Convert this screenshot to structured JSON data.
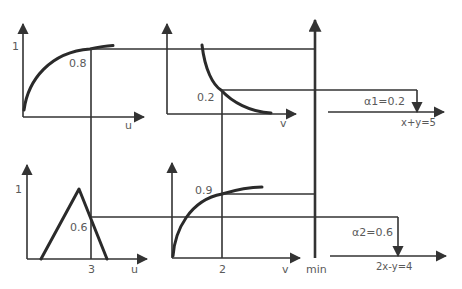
{
  "diagram": {
    "title": "",
    "colors": {
      "line": "#333333",
      "curve": "#2a2a2a",
      "text": "#5a5a5a",
      "background": "#ffffff"
    },
    "rule1": {
      "membership_u": {
        "y_tick": "1",
        "x_label": "u",
        "value_label": "0.8"
      },
      "membership_v": {
        "x_label": "v",
        "value_label": "0.2"
      },
      "result_label": "α1=0.2",
      "consequent_label": "x+y=5"
    },
    "rule2": {
      "membership_u": {
        "y_tick": "1",
        "x_label": "u",
        "x_tick": "3",
        "value_label": "0.6"
      },
      "membership_v": {
        "x_label": "v",
        "x_tick": "2",
        "value_label": "0.9"
      },
      "result_label": "α2=0.6",
      "consequent_label": "2x-y=4"
    },
    "min_axis_label": "min"
  }
}
